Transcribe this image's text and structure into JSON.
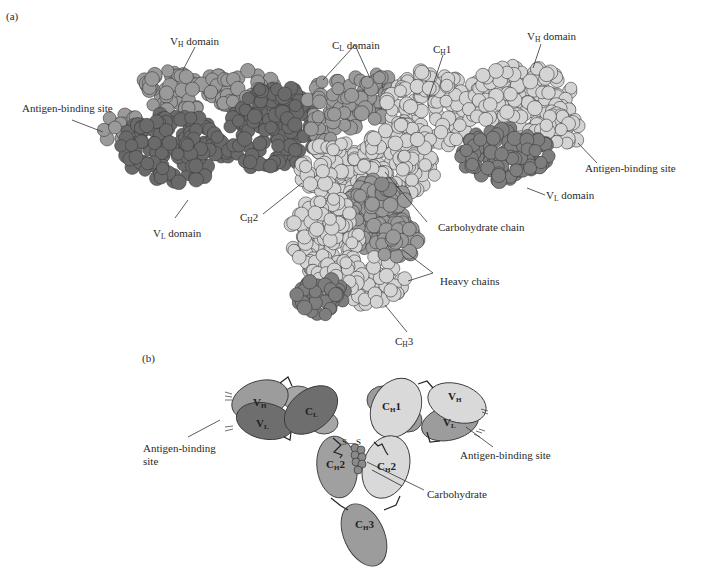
{
  "figure": {
    "panel_a": {
      "letter": "(a)",
      "title": "Space-filling model of antibody",
      "labels": {
        "vh_left": {
          "main": "V",
          "sub": "H",
          "rest": " domain"
        },
        "cl": {
          "main": "C",
          "sub": "L",
          "rest": " domain"
        },
        "ch1": {
          "main": "C",
          "sub": "H",
          "rest": "1"
        },
        "vh_right": {
          "main": "V",
          "sub": "H",
          "rest": " domain"
        },
        "antigen_left": "Antigen-binding site",
        "antigen_right": "Antigen-binding site",
        "vl_left": {
          "main": "V",
          "sub": "L",
          "rest": " domain"
        },
        "vl_right": {
          "main": "V",
          "sub": "L",
          "rest": " domain"
        },
        "ch2": {
          "main": "C",
          "sub": "H",
          "rest": "2"
        },
        "carbohydrate_chain": "Carbohydrate chain",
        "heavy_chains": "Heavy chains",
        "ch3": {
          "main": "C",
          "sub": "H",
          "rest": "3"
        }
      }
    },
    "panel_b": {
      "letter": "(b)",
      "title": "Schematic of antibody domains",
      "domains": {
        "vh_left": {
          "main": "V",
          "sub": "H"
        },
        "vl_left": {
          "main": "V",
          "sub": "L"
        },
        "cl_left": {
          "main": "C",
          "sub": "L"
        },
        "ch1_right": {
          "main": "C",
          "sub": "H",
          "rest": "1"
        },
        "vh_right": {
          "main": "V",
          "sub": "H"
        },
        "vl_right": {
          "main": "V",
          "sub": "L"
        },
        "ch2_left": {
          "main": "C",
          "sub": "H",
          "rest": "2"
        },
        "ch2_right": {
          "main": "C",
          "sub": "H",
          "rest": "2"
        },
        "ch3": {
          "main": "C",
          "sub": "H",
          "rest": "3"
        }
      },
      "disulfide": "S—S",
      "labels": {
        "antigen_left_line1": "Antigen-binding",
        "antigen_left_line2": "site",
        "antigen_right": "Antigen-binding site",
        "carbohydrate": "Carbohydrate"
      }
    },
    "colors": {
      "dark": "#6e6e6e",
      "medium": "#999999",
      "light": "#d6d6d6",
      "outline": "#3a3a3a"
    }
  }
}
